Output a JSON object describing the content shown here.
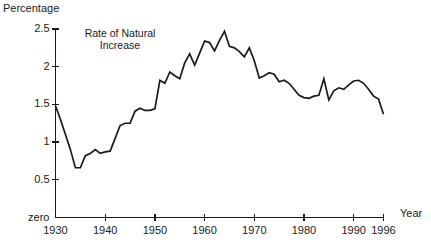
{
  "chart_data": {
    "type": "line",
    "title": "",
    "annotation": "Rate of Natural Increase",
    "xlabel": "Year",
    "ylabel": "Percentage",
    "xlim": [
      1930,
      1996
    ],
    "ylim": [
      0,
      2.5
    ],
    "grid": false,
    "legend_position": "none",
    "y_zero_label": "zero",
    "y_ticks": [
      0,
      0.5,
      1,
      1.5,
      2,
      2.5
    ],
    "y_tick_labels": [
      "zero",
      "0.5",
      "1",
      "1.5",
      "2",
      "2.5"
    ],
    "x_ticks": [
      1930,
      1940,
      1950,
      1960,
      1970,
      1980,
      1990,
      1996
    ],
    "x_tick_labels": [
      "1930",
      "1940",
      "1950",
      "1960",
      "1970",
      "1980",
      "1990",
      "1996"
    ],
    "series": [
      {
        "name": "Rate of Natural Increase",
        "color": "#1a1a1a",
        "x": [
          1930,
          1931,
          1932,
          1933,
          1934,
          1935,
          1936,
          1937,
          1938,
          1939,
          1940,
          1941,
          1942,
          1943,
          1944,
          1945,
          1946,
          1947,
          1948,
          1949,
          1950,
          1951,
          1952,
          1953,
          1954,
          1955,
          1956,
          1957,
          1958,
          1959,
          1960,
          1961,
          1962,
          1963,
          1964,
          1965,
          1966,
          1967,
          1968,
          1969,
          1970,
          1971,
          1972,
          1973,
          1974,
          1975,
          1976,
          1977,
          1978,
          1979,
          1980,
          1981,
          1982,
          1983,
          1984,
          1985,
          1986,
          1987,
          1988,
          1989,
          1990,
          1991,
          1992,
          1993,
          1994,
          1995,
          1996
        ],
        "values": [
          1.48,
          1.3,
          1.1,
          0.9,
          0.66,
          0.66,
          0.82,
          0.85,
          0.9,
          0.85,
          0.87,
          0.88,
          1.05,
          1.22,
          1.25,
          1.25,
          1.41,
          1.45,
          1.42,
          1.42,
          1.44,
          1.82,
          1.78,
          1.93,
          1.88,
          1.84,
          2.05,
          2.17,
          2.02,
          2.18,
          2.34,
          2.32,
          2.21,
          2.35,
          2.47,
          2.27,
          2.25,
          2.2,
          2.13,
          2.25,
          2.08,
          1.85,
          1.88,
          1.92,
          1.9,
          1.8,
          1.82,
          1.78,
          1.7,
          1.62,
          1.59,
          1.58,
          1.61,
          1.62,
          1.84,
          1.56,
          1.68,
          1.72,
          1.7,
          1.76,
          1.81,
          1.82,
          1.78,
          1.7,
          1.61,
          1.57,
          1.37
        ]
      }
    ]
  },
  "axes": {
    "y_title": "Percentage",
    "x_title": "Year"
  }
}
